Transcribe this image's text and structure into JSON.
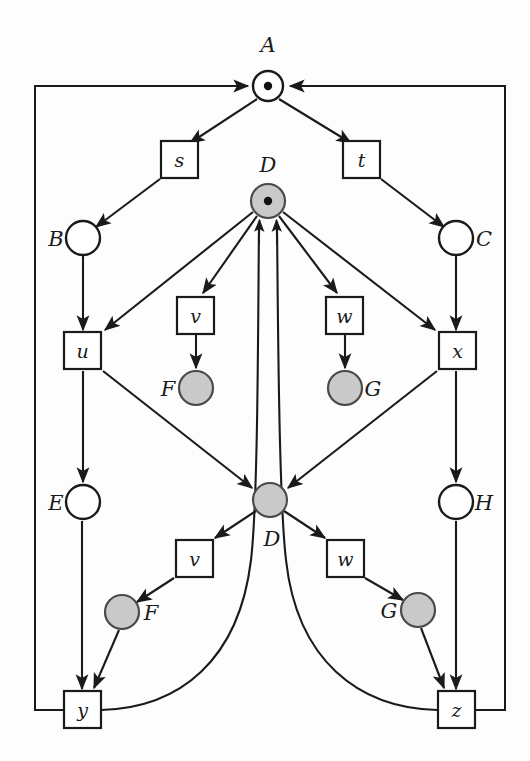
{
  "figure": {
    "kind": "petri-net-diagram",
    "width": 530,
    "height": 761,
    "background_color": "#fdfdfd",
    "line_color": "#1a1a1a",
    "shaded_fill": "#c9c9c9",
    "open_fill": "#ffffff",
    "token_color": "#111111"
  },
  "places": [
    {
      "id": "A",
      "label": "A",
      "cx": 268,
      "cy": 86,
      "r": 15,
      "fill": "open",
      "token": true,
      "label_x": 268,
      "label_y": 52,
      "label_anchor": "middle"
    },
    {
      "id": "D1",
      "label": "D",
      "cx": 268,
      "cy": 201,
      "r": 17,
      "fill": "shaded",
      "token": true,
      "label_x": 268,
      "label_y": 172,
      "label_anchor": "middle"
    },
    {
      "id": "B",
      "label": "B",
      "cx": 83,
      "cy": 238,
      "r": 17,
      "fill": "open",
      "token": false,
      "label_x": 56,
      "label_y": 246,
      "label_anchor": "middle"
    },
    {
      "id": "C",
      "label": "C",
      "cx": 456,
      "cy": 238,
      "r": 17,
      "fill": "open",
      "token": false,
      "label_x": 484,
      "label_y": 246,
      "label_anchor": "middle"
    },
    {
      "id": "F1",
      "label": "F",
      "cx": 196,
      "cy": 388,
      "r": 17,
      "fill": "shaded",
      "token": false,
      "label_x": 168,
      "label_y": 396,
      "label_anchor": "middle"
    },
    {
      "id": "G1",
      "label": "G",
      "cx": 345,
      "cy": 388,
      "r": 17,
      "fill": "shaded",
      "token": false,
      "label_x": 373,
      "label_y": 396,
      "label_anchor": "middle"
    },
    {
      "id": "E",
      "label": "E",
      "cx": 83,
      "cy": 502,
      "r": 17,
      "fill": "open",
      "token": false,
      "label_x": 56,
      "label_y": 510,
      "label_anchor": "middle"
    },
    {
      "id": "D2",
      "label": "D",
      "cx": 270,
      "cy": 500,
      "r": 17,
      "fill": "shaded",
      "token": false,
      "label_x": 272,
      "label_y": 546,
      "label_anchor": "middle"
    },
    {
      "id": "H",
      "label": "H",
      "cx": 456,
      "cy": 502,
      "r": 17,
      "fill": "open",
      "token": false,
      "label_x": 484,
      "label_y": 510,
      "label_anchor": "middle"
    },
    {
      "id": "F2",
      "label": "F",
      "cx": 122,
      "cy": 612,
      "r": 17,
      "fill": "shaded",
      "token": false,
      "label_x": 151,
      "label_y": 620,
      "label_anchor": "middle"
    },
    {
      "id": "G2",
      "label": "G",
      "cx": 418,
      "cy": 610,
      "r": 17,
      "fill": "shaded",
      "token": false,
      "label_x": 389,
      "label_y": 618,
      "label_anchor": "middle"
    }
  ],
  "transitions": [
    {
      "id": "s",
      "label": "s",
      "x": 161,
      "y": 141,
      "w": 37,
      "h": 37
    },
    {
      "id": "t",
      "label": "t",
      "x": 343,
      "y": 141,
      "w": 37,
      "h": 37
    },
    {
      "id": "u",
      "label": "u",
      "x": 64,
      "y": 332,
      "w": 37,
      "h": 37
    },
    {
      "id": "x",
      "label": "x",
      "x": 439,
      "y": 332,
      "w": 37,
      "h": 37
    },
    {
      "id": "v1",
      "label": "v",
      "x": 177,
      "y": 297,
      "w": 37,
      "h": 37
    },
    {
      "id": "w1",
      "label": "w",
      "x": 326,
      "y": 297,
      "w": 37,
      "h": 37
    },
    {
      "id": "v2",
      "label": "v",
      "x": 176,
      "y": 540,
      "w": 37,
      "h": 37
    },
    {
      "id": "w2",
      "label": "w",
      "x": 327,
      "y": 540,
      "w": 37,
      "h": 37
    },
    {
      "id": "y",
      "label": "y",
      "x": 64,
      "y": 691,
      "w": 37,
      "h": 37
    },
    {
      "id": "z",
      "label": "z",
      "x": 438,
      "y": 691,
      "w": 37,
      "h": 37
    }
  ],
  "arcs": [
    {
      "from": "A",
      "to": "s",
      "kind": "arrow"
    },
    {
      "from": "A",
      "to": "t",
      "kind": "arrow"
    },
    {
      "from": "s",
      "to": "B",
      "kind": "arrow"
    },
    {
      "from": "t",
      "to": "C",
      "kind": "arrow"
    },
    {
      "from": "B",
      "to": "u",
      "kind": "arrow"
    },
    {
      "from": "C",
      "to": "x",
      "kind": "arrow"
    },
    {
      "from": "D1",
      "to": "u",
      "kind": "arrow"
    },
    {
      "from": "D1",
      "to": "v1",
      "kind": "arrow"
    },
    {
      "from": "D1",
      "to": "w1",
      "kind": "arrow"
    },
    {
      "from": "D1",
      "to": "x",
      "kind": "arrow"
    },
    {
      "from": "v1",
      "to": "F1",
      "kind": "arrow"
    },
    {
      "from": "w1",
      "to": "G1",
      "kind": "arrow"
    },
    {
      "from": "u",
      "to": "E",
      "kind": "arrow"
    },
    {
      "from": "u",
      "to": "D2",
      "kind": "arrow"
    },
    {
      "from": "x",
      "to": "H",
      "kind": "arrow"
    },
    {
      "from": "x",
      "to": "D2",
      "kind": "arrow"
    },
    {
      "from": "D2",
      "to": "v2",
      "kind": "arrow"
    },
    {
      "from": "D2",
      "to": "w2",
      "kind": "arrow"
    },
    {
      "from": "v2",
      "to": "F2",
      "kind": "arrow"
    },
    {
      "from": "w2",
      "to": "G2",
      "kind": "arrow"
    },
    {
      "from": "E",
      "to": "y",
      "kind": "arrow"
    },
    {
      "from": "F2",
      "to": "y",
      "kind": "arrow"
    },
    {
      "from": "H",
      "to": "z",
      "kind": "arrow"
    },
    {
      "from": "G2",
      "to": "z",
      "kind": "arrow"
    },
    {
      "from": "y",
      "to": "D1",
      "kind": "curve-feedback-left"
    },
    {
      "from": "z",
      "to": "D1",
      "kind": "curve-feedback-right"
    },
    {
      "from": "y",
      "to": "A",
      "kind": "frame-left"
    },
    {
      "from": "z",
      "to": "A",
      "kind": "frame-right"
    }
  ],
  "frame": {
    "left_x": 35,
    "right_x": 505,
    "top_y": 86,
    "bottom_y": 710
  }
}
